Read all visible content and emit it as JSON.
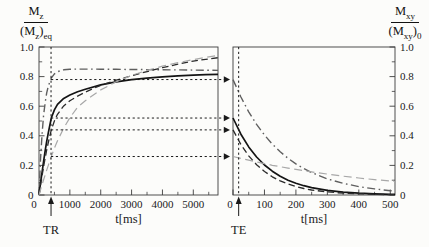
{
  "figure": {
    "left_axis_fraction": {
      "num_base": "M",
      "num_sub": "z",
      "den_open": "(M",
      "den_sub": "z",
      "den_close": ")",
      "den_sub2": "eq"
    },
    "right_axis_fraction": {
      "num_base": "M",
      "num_sub": "xy",
      "den_open": "(M",
      "den_sub": "xy",
      "den_close": ")",
      "den_sub2": "0"
    }
  },
  "mapping_arrows": {
    "values": [
      0.78,
      0.52,
      0.44,
      0.26
    ]
  },
  "chart_data": [
    {
      "type": "line",
      "id": "longitudinal-recovery",
      "xlabel": "t[ms]",
      "xlim": [
        0,
        5800
      ],
      "ylim": [
        0,
        1
      ],
      "y_axis_side": "left",
      "grid": false,
      "x_ticks_major": [
        0,
        1000,
        2000,
        3000,
        4000,
        5000
      ],
      "x_tick_labels": [
        "0",
        "1000",
        "2000",
        "3000",
        "4000",
        "5000"
      ],
      "x_ticks_minor": [
        500,
        1500,
        2500,
        3500,
        4500,
        5500
      ],
      "y_ticks_major": [
        0,
        0.2,
        0.4,
        0.6,
        0.8,
        1.0
      ],
      "y_tick_labels": [
        "0",
        "0.2",
        "0.4",
        "0.6",
        "0.8",
        "1.0"
      ],
      "y_ticks_minor": [
        0.1,
        0.3,
        0.5,
        0.7,
        0.9
      ],
      "marker": {
        "label": "TR",
        "t": 390
      },
      "series": [
        {
          "name": "dash-dot (short T1)",
          "style": "dashdot",
          "color": "#5f5f5f",
          "width": 1.4,
          "x": [
            0,
            50,
            100,
            150,
            200,
            250,
            300,
            400,
            500,
            600,
            800,
            1000,
            1250,
            1500,
            2000,
            2500,
            3000,
            3500,
            4000,
            4500,
            5000,
            5400,
            5800
          ],
          "y": [
            0,
            0.24,
            0.414,
            0.54,
            0.625,
            0.69,
            0.735,
            0.79,
            0.818,
            0.833,
            0.846,
            0.85,
            0.851,
            0.851,
            0.85,
            0.849,
            0.848,
            0.847,
            0.846,
            0.845,
            0.844,
            0.843,
            0.842
          ]
        },
        {
          "name": "solid",
          "style": "solid",
          "color": "#141414",
          "width": 1.7,
          "x": [
            0,
            50,
            100,
            150,
            200,
            250,
            300,
            400,
            500,
            600,
            800,
            1000,
            1250,
            1500,
            2000,
            2500,
            3000,
            3500,
            4000,
            4500,
            5000,
            5400,
            5800
          ],
          "y": [
            0,
            0.08,
            0.155,
            0.228,
            0.3,
            0.363,
            0.42,
            0.52,
            0.575,
            0.613,
            0.653,
            0.676,
            0.698,
            0.714,
            0.744,
            0.765,
            0.779,
            0.79,
            0.798,
            0.805,
            0.81,
            0.813,
            0.815
          ]
        },
        {
          "name": "dashed",
          "style": "dashed",
          "color": "#2b2b2b",
          "width": 1.3,
          "x": [
            0,
            50,
            100,
            150,
            200,
            250,
            300,
            400,
            500,
            600,
            800,
            1000,
            1250,
            1500,
            2000,
            2500,
            3000,
            3500,
            4000,
            4500,
            5000,
            5400,
            5800
          ],
          "y": [
            0,
            0.067,
            0.13,
            0.193,
            0.25,
            0.305,
            0.355,
            0.44,
            0.5,
            0.545,
            0.602,
            0.637,
            0.668,
            0.695,
            0.741,
            0.776,
            0.806,
            0.834,
            0.86,
            0.884,
            0.905,
            0.917,
            0.928
          ]
        },
        {
          "name": "gray dashed (long T1)",
          "style": "longdash",
          "color": "#a8a8a8",
          "width": 1.2,
          "x": [
            0,
            50,
            100,
            150,
            200,
            250,
            300,
            400,
            500,
            600,
            800,
            1000,
            1250,
            1500,
            2000,
            2500,
            3000,
            3500,
            4000,
            4500,
            5000,
            5400,
            5800
          ],
          "y": [
            0,
            0.035,
            0.07,
            0.103,
            0.136,
            0.168,
            0.2,
            0.26,
            0.316,
            0.366,
            0.452,
            0.522,
            0.594,
            0.637,
            0.71,
            0.765,
            0.808,
            0.842,
            0.87,
            0.894,
            0.915,
            0.93,
            0.944
          ]
        }
      ]
    },
    {
      "type": "line",
      "id": "transverse-decay",
      "xlabel": "t[ms]",
      "xlim": [
        0,
        515
      ],
      "ylim": [
        0,
        1
      ],
      "y_axis_side": "right",
      "grid": false,
      "x_ticks_major": [
        0,
        100,
        200,
        300,
        400,
        500
      ],
      "x_tick_labels": [
        "0",
        "100",
        "200",
        "300",
        "400",
        "500"
      ],
      "x_ticks_minor": [
        50,
        150,
        250,
        350,
        450
      ],
      "y_ticks_major": [
        0,
        0.2,
        0.4,
        0.6,
        0.8,
        1.0
      ],
      "y_tick_labels": [
        "0",
        "0.2",
        "0.4",
        "0.6",
        "0.8",
        "1.0"
      ],
      "y_ticks_minor": [
        0.1,
        0.3,
        0.5,
        0.7,
        0.9
      ],
      "marker": {
        "label": "TE",
        "t": 18
      },
      "series": [
        {
          "name": "dash-dot (starts 0.78)",
          "style": "dashdot",
          "color": "#5f5f5f",
          "width": 1.4,
          "x": [
            0,
            25,
            50,
            75,
            100,
            125,
            150,
            175,
            200,
            225,
            250,
            300,
            350,
            400,
            450,
            500,
            515
          ],
          "y": [
            0.78,
            0.662,
            0.562,
            0.477,
            0.405,
            0.344,
            0.292,
            0.248,
            0.21,
            0.179,
            0.152,
            0.109,
            0.079,
            0.057,
            0.041,
            0.029,
            0.027
          ]
        },
        {
          "name": "solid (starts 0.52)",
          "style": "solid",
          "color": "#141414",
          "width": 1.7,
          "x": [
            0,
            25,
            50,
            75,
            100,
            125,
            150,
            175,
            200,
            225,
            250,
            300,
            350,
            400,
            450,
            500,
            515
          ],
          "y": [
            0.52,
            0.411,
            0.325,
            0.257,
            0.203,
            0.161,
            0.127,
            0.1,
            0.079,
            0.063,
            0.05,
            0.031,
            0.019,
            0.012,
            0.008,
            0.005,
            0.005
          ]
        },
        {
          "name": "dashed (starts 0.44)",
          "style": "dashed",
          "color": "#2b2b2b",
          "width": 1.3,
          "x": [
            0,
            25,
            50,
            75,
            100,
            125,
            150,
            175,
            200,
            225,
            250,
            300,
            350,
            400,
            450,
            500,
            515
          ],
          "y": [
            0.44,
            0.341,
            0.264,
            0.205,
            0.159,
            0.123,
            0.095,
            0.074,
            0.057,
            0.044,
            0.034,
            0.021,
            0.012,
            0.008,
            0.005,
            0.003,
            0.003
          ]
        },
        {
          "name": "gray dashed (long T2, starts 0.26)",
          "style": "longdash",
          "color": "#a8a8a8",
          "width": 1.2,
          "x": [
            0,
            25,
            50,
            75,
            100,
            125,
            150,
            175,
            200,
            225,
            250,
            300,
            350,
            400,
            450,
            500,
            515
          ],
          "y": [
            0.26,
            0.247,
            0.235,
            0.223,
            0.212,
            0.201,
            0.191,
            0.182,
            0.173,
            0.164,
            0.156,
            0.141,
            0.127,
            0.115,
            0.104,
            0.094,
            0.091
          ]
        }
      ]
    }
  ]
}
